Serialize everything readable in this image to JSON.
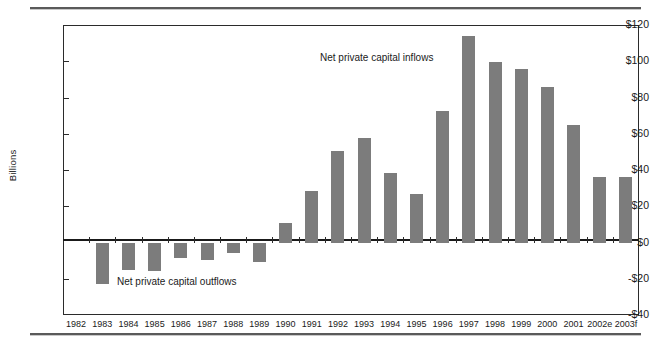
{
  "chart_data": {
    "type": "bar",
    "title": "",
    "xlabel": "",
    "ylabel": "Billions",
    "ylim": [
      -40,
      120
    ],
    "yticks": [
      -40,
      -20,
      0,
      20,
      40,
      60,
      80,
      100,
      120
    ],
    "ytick_labels": [
      "-$40",
      "-$20",
      "$0",
      "$20",
      "$40",
      "$60",
      "$80",
      "$100",
      "$120"
    ],
    "grid": false,
    "legend": "none",
    "bar_color": "#7c7c7c",
    "categories": [
      "1982",
      "1983",
      "1984",
      "1985",
      "1986",
      "1987",
      "1988",
      "1989",
      "1990",
      "1991",
      "1992",
      "1993",
      "1994",
      "1995",
      "1996",
      "1997",
      "1998",
      "1999",
      "2000",
      "2001",
      "2002e",
      "2003f"
    ],
    "values": [
      0,
      -23,
      -15,
      -15.5,
      -8.5,
      -9.5,
      -6,
      -10.5,
      11,
      28.5,
      50.5,
      57.5,
      38.5,
      27,
      72.5,
      114,
      99.5,
      95.5,
      86,
      65,
      36,
      36
    ],
    "annotations": [
      {
        "text": "Net private capital inflows",
        "x": "1993",
        "y": 96
      },
      {
        "text": "Net private capital outflows",
        "x": "1985",
        "y": -25
      }
    ]
  }
}
